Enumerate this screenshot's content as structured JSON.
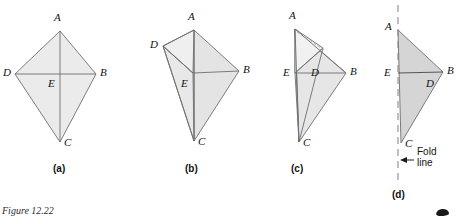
{
  "figure": {
    "caption": "Figure 12.22",
    "corner_mark": "page-corner-mark",
    "stroke_color": "#6e6e6e",
    "fill_light": "#ebebeb",
    "fill_medium": "#e2e2e2",
    "fill_dark": "#d5d5d5",
    "dash_color": "#8c8c8c"
  },
  "panels": [
    {
      "id": "a",
      "caption": "(a)",
      "caption_pos": {
        "x": 53,
        "y": 163
      },
      "description": "kite ABCD with diagonals meeting at E",
      "vertices": [
        {
          "name": "A",
          "x": 60,
          "y": 31,
          "label_x": 54,
          "label_y": 11
        },
        {
          "name": "D",
          "x": 15,
          "y": 74,
          "label_x": 3,
          "label_y": 66
        },
        {
          "name": "B",
          "x": 96,
          "y": 74,
          "label_x": 100,
          "label_y": 66
        },
        {
          "name": "C",
          "x": 60,
          "y": 142,
          "label_x": 64,
          "label_y": 136
        },
        {
          "name": "E",
          "x": 60,
          "y": 74,
          "label_x": 48,
          "label_y": 77
        }
      ]
    },
    {
      "id": "b",
      "caption": "(b)",
      "caption_pos": {
        "x": 185,
        "y": 163
      },
      "description": "triangle ADE folded upward about diagonal AE",
      "vertices": [
        {
          "name": "A",
          "x": 194,
          "y": 30,
          "label_x": 188,
          "label_y": 10
        },
        {
          "name": "D",
          "x": 163,
          "y": 46,
          "label_x": 150,
          "label_y": 38
        },
        {
          "name": "B",
          "x": 239,
          "y": 71,
          "label_x": 243,
          "label_y": 63
        },
        {
          "name": "C",
          "x": 194,
          "y": 141,
          "label_x": 198,
          "label_y": 135
        },
        {
          "name": "E",
          "x": 193,
          "y": 73,
          "label_x": 181,
          "label_y": 77
        }
      ]
    },
    {
      "id": "c",
      "caption": "(c)",
      "caption_pos": {
        "x": 291,
        "y": 163
      },
      "description": "triangle ADE folded further toward diagonal AC",
      "vertices": [
        {
          "name": "A",
          "x": 295,
          "y": 29,
          "label_x": 289,
          "label_y": 9
        },
        {
          "name": "D",
          "x": 323,
          "y": 48,
          "label_x": 311,
          "label_y": 66
        },
        {
          "name": "B",
          "x": 346,
          "y": 73,
          "label_x": 350,
          "label_y": 65
        },
        {
          "name": "C",
          "x": 299,
          "y": 142,
          "label_x": 303,
          "label_y": 136
        },
        {
          "name": "E",
          "x": 295,
          "y": 73,
          "label_x": 283,
          "label_y": 66
        }
      ]
    },
    {
      "id": "d",
      "caption": "(d)",
      "caption_pos": {
        "x": 392,
        "y": 189
      },
      "description": "triangle ABC after the fold, flush with the fold line",
      "vertices": [
        {
          "name": "A",
          "x": 398,
          "y": 30,
          "label_x": 385,
          "label_y": 20
        },
        {
          "name": "B",
          "x": 443,
          "y": 72,
          "label_x": 447,
          "label_y": 64
        },
        {
          "name": "C",
          "x": 401,
          "y": 143,
          "label_x": 405,
          "label_y": 137
        },
        {
          "name": "D",
          "x": 432,
          "y": 73,
          "label_x": 426,
          "label_y": 77
        },
        {
          "name": "E",
          "x": 398,
          "y": 73,
          "label_x": 384,
          "label_y": 66
        }
      ],
      "fold_line": {
        "label_line1": "Fold",
        "label_line2": "line",
        "label_x": 417,
        "label_y": 146,
        "x": 398,
        "y_top": 5,
        "y_bottom": 182,
        "arrow_from_x": 414,
        "arrow_to_x": 401,
        "arrow_y": 160
      }
    }
  ]
}
